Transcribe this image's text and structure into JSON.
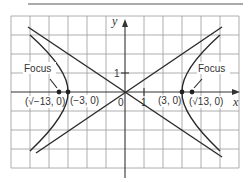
{
  "figure": {
    "type": "hyperbola-graph",
    "axes": {
      "x_label": "x",
      "y_label": "y",
      "origin_label": "0",
      "x_tick_label": "1",
      "y_tick_label": "1"
    },
    "grid": {
      "x_range": [
        -6,
        6
      ],
      "y_range": [
        -4,
        4
      ],
      "unit": 1
    },
    "labels": {
      "focus_left": "Focus",
      "focus_right": "Focus",
      "left_focus_point": "(√−13, 0)",
      "left_vertex": "(−3, 0)",
      "right_vertex": "(3, 0)",
      "right_focus_point": "(√13, 0)"
    },
    "points": [
      {
        "name": "left-focus",
        "x": -3.606,
        "y": 0
      },
      {
        "name": "left-vertex",
        "x": -3,
        "y": 0
      },
      {
        "name": "right-vertex",
        "x": 3,
        "y": 0
      },
      {
        "name": "right-focus",
        "x": 3.606,
        "y": 0
      }
    ],
    "asymptotes": [
      "y = 2x/3",
      "y = -2x/3"
    ],
    "colors": {
      "grid": "#9a9a9a",
      "curve": "#2a2a2a",
      "text": "#333333"
    }
  }
}
